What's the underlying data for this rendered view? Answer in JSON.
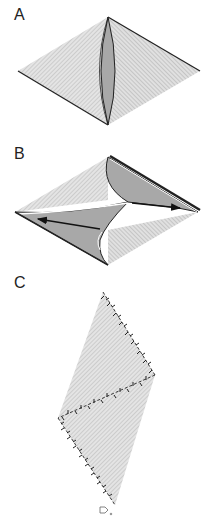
{
  "figure": {
    "panels": [
      {
        "label": "A",
        "description": "Rhombus with central lens-shaped shaded fold"
      },
      {
        "label": "B",
        "description": "Rhombus split with shaded flaps and opposing arrows"
      },
      {
        "label": "C",
        "description": "Rhombus outlined with stitched/tacked edges"
      }
    ]
  },
  "colors": {
    "hatch_fill": "#d9d9d9",
    "hatch_line": "#b8b8b8",
    "shade_fill": "#a8a8a8",
    "outline": "#222222",
    "label": "#222222"
  }
}
